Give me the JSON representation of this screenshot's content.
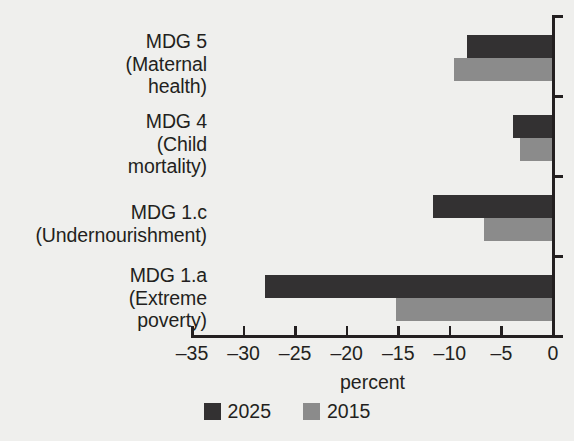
{
  "chart_data": {
    "type": "bar",
    "orientation": "horizontal",
    "title": "",
    "xlabel": "percent",
    "ylabel": "",
    "xlim": [
      -35,
      0
    ],
    "xticks": [
      -35,
      -30,
      -25,
      -20,
      -15,
      -10,
      -5,
      0
    ],
    "xticklabels": [
      "–35",
      "–30",
      "–25",
      "–20",
      "–15",
      "–10",
      "–5",
      "0"
    ],
    "grid": false,
    "legend_position": "bottom-center",
    "categories": [
      "MDG 5 (Maternal health)",
      "MDG 4 (Child mortality)",
      "MDG 1.c (Undernourishment)",
      "MDG 1.a (Extreme poverty)"
    ],
    "category_label_lines": [
      [
        "MDG 5",
        "(Maternal",
        "health)"
      ],
      [
        "MDG 4",
        "(Child",
        "mortality)"
      ],
      [
        "MDG 1.c",
        "(Undernourishment)"
      ],
      [
        "MDG 1.a",
        "(Extreme",
        "poverty)"
      ]
    ],
    "series": [
      {
        "name": "2025",
        "color": "#333132",
        "values": [
          -8.2,
          -3.8,
          -11.5,
          -27.8
        ]
      },
      {
        "name": "2015",
        "color": "#8b8b8b",
        "values": [
          -9.5,
          -3.1,
          -6.6,
          -15.1
        ]
      }
    ]
  },
  "legend": {
    "items": [
      {
        "label": "2025",
        "color": "#333132"
      },
      {
        "label": "2015",
        "color": "#8b8b8b"
      }
    ]
  },
  "axis": {
    "x_title": "percent"
  }
}
